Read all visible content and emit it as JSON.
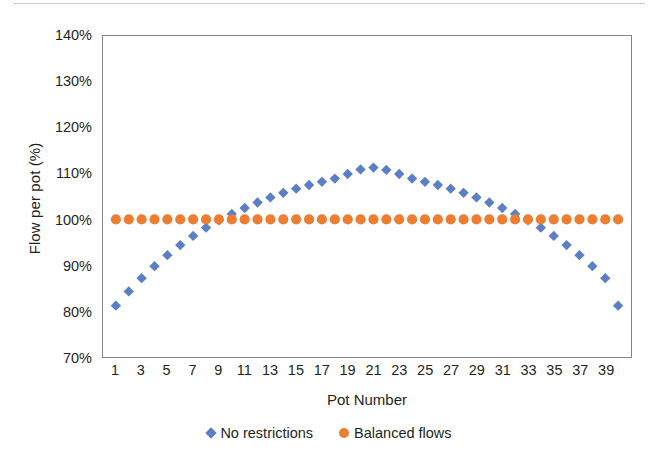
{
  "chart_data": {
    "type": "scatter",
    "title": "",
    "xlabel": "Pot Number",
    "ylabel": "Flow per pot (%)",
    "xlim": [
      0,
      41
    ],
    "ylim": [
      70,
      140
    ],
    "yticks": [
      "70%",
      "80%",
      "90%",
      "100%",
      "110%",
      "120%",
      "130%",
      "140%"
    ],
    "ytick_values": [
      70,
      80,
      90,
      100,
      110,
      120,
      130,
      140
    ],
    "ytick_unit": "%",
    "xticks": [
      "1",
      "3",
      "5",
      "7",
      "9",
      "11",
      "13",
      "15",
      "17",
      "19",
      "21",
      "23",
      "25",
      "27",
      "29",
      "31",
      "33",
      "35",
      "37",
      "39"
    ],
    "xtick_values": [
      1,
      3,
      5,
      7,
      9,
      11,
      13,
      15,
      17,
      19,
      21,
      23,
      25,
      27,
      29,
      31,
      33,
      35,
      37,
      39
    ],
    "grid": false,
    "legend_position": "bottom",
    "x": [
      1,
      2,
      3,
      4,
      5,
      6,
      7,
      8,
      9,
      10,
      11,
      12,
      13,
      14,
      15,
      16,
      17,
      18,
      19,
      20,
      21,
      22,
      23,
      24,
      25,
      26,
      27,
      28,
      29,
      30,
      31,
      32,
      33,
      34,
      35,
      36,
      37,
      38,
      39,
      40
    ],
    "series": [
      {
        "name": "No restrictions",
        "color": "#5B7FC7",
        "marker": "diamond",
        "values": [
          81.2,
          84.3,
          87.2,
          89.8,
          92.2,
          94.4,
          96.4,
          98.2,
          99.8,
          101.2,
          102.5,
          103.7,
          104.8,
          105.8,
          106.7,
          107.5,
          108.2,
          108.9,
          109.9,
          110.9,
          111.3,
          110.8,
          109.9,
          108.9,
          108.2,
          107.5,
          106.7,
          105.8,
          104.8,
          103.7,
          102.5,
          101.2,
          99.8,
          98.2,
          96.4,
          94.4,
          92.2,
          89.8,
          87.2,
          81.2
        ]
      },
      {
        "name": "Balanced flows",
        "color": "#ED7D31",
        "marker": "circle",
        "values": [
          100,
          100,
          100,
          100,
          100,
          100,
          100,
          100,
          100,
          100,
          100,
          100,
          100,
          100,
          100,
          100,
          100,
          100,
          100,
          100,
          100,
          100,
          100,
          100,
          100,
          100,
          100,
          100,
          100,
          100,
          100,
          100,
          100,
          100,
          100,
          100,
          100,
          100,
          100,
          100
        ]
      }
    ]
  },
  "legend": {
    "entries": [
      {
        "label": "No restrictions"
      },
      {
        "label": "Balanced flows"
      }
    ]
  },
  "axes": {
    "frame_color": "#868686"
  }
}
